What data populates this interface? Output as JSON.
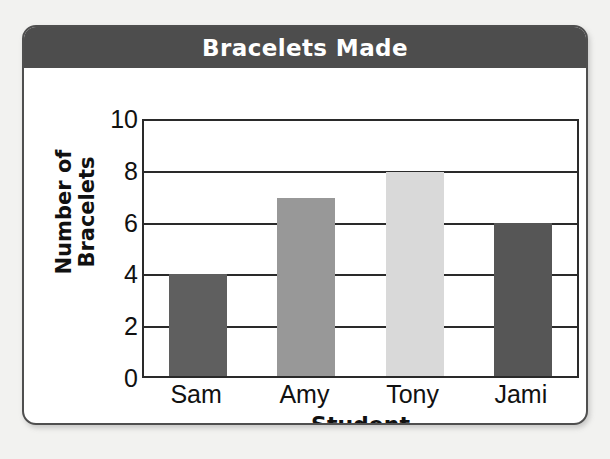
{
  "chart_data": {
    "type": "bar",
    "title": "Bracelets Made",
    "xlabel": "Student",
    "ylabel": "Number of Bracelets",
    "ylabel_line1": "Number of",
    "ylabel_line2": "Bracelets",
    "categories": [
      "Sam",
      "Amy",
      "Tony",
      "Jami"
    ],
    "values": [
      4,
      7,
      8,
      6
    ],
    "ylim": [
      0,
      10
    ],
    "yticks": [
      0,
      2,
      4,
      6,
      8,
      10
    ],
    "ytick_labels": [
      "0",
      "2",
      "4",
      "6",
      "8",
      "10"
    ],
    "grid": true,
    "grid_axis": "y",
    "legend": false,
    "bar_colors": [
      "#5f5f5f",
      "#989898",
      "#d9d9d9",
      "#565656"
    ],
    "series": [
      {
        "name": "Bracelets Made",
        "points": [
          {
            "category": "Sam",
            "value": 4,
            "color": "#5f5f5f"
          },
          {
            "category": "Amy",
            "value": 7,
            "color": "#989898"
          },
          {
            "category": "Tony",
            "value": 8,
            "color": "#d9d9d9"
          },
          {
            "category": "Jami",
            "value": 6,
            "color": "#565656"
          }
        ]
      }
    ]
  },
  "style": {
    "title_band_color": "#4d4d4d",
    "title_text_color": "#ffffff",
    "axis_color": "#2a2a2a",
    "card_border_color": "#4f4f4f",
    "page_background": "#f2f2f0",
    "plot_background": "#ffffff"
  }
}
